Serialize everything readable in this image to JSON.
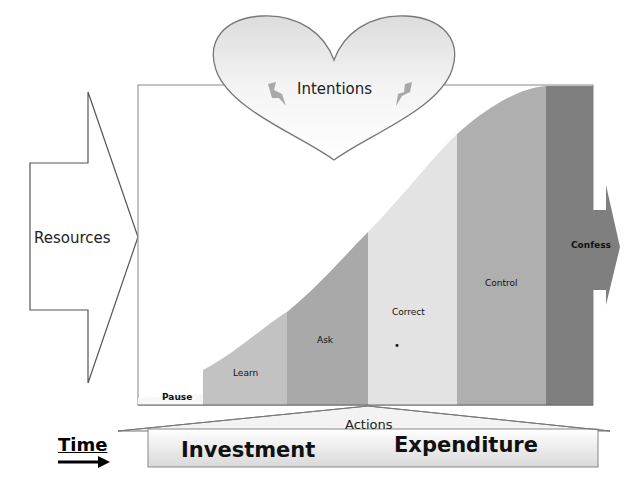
{
  "diagram": {
    "intentions_label": "Intentions",
    "resources_label": "Resources",
    "actions_label": "Actions",
    "time_label": "Time",
    "investment_label": "Investment",
    "expenditure_label": "Expenditure",
    "stages": [
      {
        "label": "Pause",
        "color": "#fafafa"
      },
      {
        "label": "Learn",
        "color": "#c2c2c2"
      },
      {
        "label": "Ask",
        "color": "#a9a9a9"
      },
      {
        "label": "Correct",
        "color": "#e3e3e3"
      },
      {
        "label": "Control",
        "color": "#afafaf"
      },
      {
        "label": "Confess",
        "color": "#7f7f7f"
      }
    ],
    "correct_marker": "•"
  }
}
